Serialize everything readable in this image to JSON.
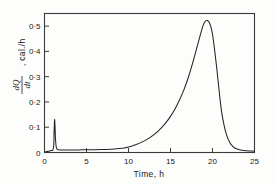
{
  "figure": {
    "background_color": "#fdfdfc",
    "frame_color": "#3a3a3a",
    "curve_color": "#242424"
  },
  "axes": {
    "y_tick_labels": [
      "0",
      "0·1",
      "0·2",
      "0·3",
      "0·4",
      "0·5"
    ],
    "x_tick_labels": [
      "0",
      "5",
      "10",
      "15",
      "20",
      "25"
    ],
    "y_title_numerator": "dQ",
    "y_title_denominator": "dt",
    "y_title_units": ", cal./h",
    "x_title": "Time,  h"
  },
  "chart_data": {
    "type": "line",
    "title": "",
    "xlabel": "Time,  h",
    "ylabel": "dQ/dt , cal./h",
    "xlim": [
      0,
      25
    ],
    "ylim": [
      0,
      0.55
    ],
    "xticks": [
      0,
      5,
      10,
      15,
      20,
      25
    ],
    "yticks": [
      0,
      0.1,
      0.2,
      0.3,
      0.4,
      0.5
    ],
    "grid": false,
    "legend": "none",
    "frame": "box",
    "tick_direction": "in",
    "annotations": [
      "Initial sharp spike near t = 1.2 h reaching ~0.13 cal./h",
      "Long quiescent lag phase from t = 1.5 h to t = 9 h at ~0.01 cal./h",
      "Exponential autocatalytic rise from t = 10 h to t = 19 h",
      "Maximum of ~0.52 cal./h at t = 19.4 h",
      "Rapid decay back to baseline by t = 22.5 h"
    ],
    "series": [
      {
        "name": "Heat evolution rate",
        "x": [
          0.0,
          0.3,
          0.6,
          0.85,
          1.0,
          1.1,
          1.15,
          1.2,
          1.25,
          1.3,
          1.38,
          1.5,
          1.7,
          2.0,
          2.5,
          3.0,
          4.0,
          5.0,
          6.0,
          7.0,
          8.0,
          9.0,
          9.5,
          10.0,
          10.5,
          11.0,
          11.5,
          12.0,
          12.5,
          13.0,
          13.5,
          14.0,
          14.5,
          15.0,
          15.5,
          16.0,
          16.5,
          17.0,
          17.5,
          18.0,
          18.4,
          18.8,
          19.0,
          19.2,
          19.4,
          19.6,
          19.8,
          20.0,
          20.2,
          20.45,
          20.7,
          20.9,
          21.1,
          21.35,
          21.6,
          21.9,
          22.2,
          22.6,
          23.0,
          23.5,
          24.0,
          24.5,
          25.0
        ],
        "y": [
          0.002,
          0.004,
          0.006,
          0.008,
          0.01,
          0.03,
          0.09,
          0.13,
          0.105,
          0.06,
          0.025,
          0.013,
          0.011,
          0.01,
          0.01,
          0.01,
          0.01,
          0.011,
          0.011,
          0.012,
          0.013,
          0.016,
          0.018,
          0.022,
          0.027,
          0.033,
          0.04,
          0.048,
          0.058,
          0.07,
          0.084,
          0.1,
          0.12,
          0.143,
          0.17,
          0.203,
          0.24,
          0.285,
          0.338,
          0.398,
          0.447,
          0.494,
          0.512,
          0.521,
          0.522,
          0.515,
          0.498,
          0.468,
          0.42,
          0.35,
          0.272,
          0.21,
          0.158,
          0.112,
          0.078,
          0.05,
          0.032,
          0.019,
          0.013,
          0.009,
          0.007,
          0.006,
          0.005
        ]
      }
    ]
  }
}
